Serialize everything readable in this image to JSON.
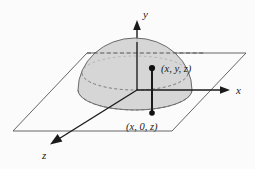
{
  "figure": {
    "name": "hemisphere-on-xz-plane-diagram",
    "background_color": "#fbfbfb",
    "stroke_color": "#1a1a1a",
    "plane_stroke_color": "#555555",
    "dome_fill_color": "#d2d2d2",
    "dome_stroke_color": "#6a6a6a",
    "dashed_stroke_color": "#707070"
  },
  "axes": {
    "y": {
      "label": "y",
      "label_x": 143,
      "label_y": 18,
      "arrow": "up"
    },
    "x": {
      "label": "x",
      "label_x": 236,
      "label_y": 94,
      "arrow": "right"
    },
    "z": {
      "label": "z",
      "label_x": 42,
      "label_y": 159,
      "arrow": "down-left"
    }
  },
  "points": [
    {
      "id": "point-upper",
      "label": "(x, y, z)",
      "dot_x": 152,
      "dot_y": 68,
      "label_x": 161,
      "label_y": 72
    },
    {
      "id": "point-lower",
      "label": "(x, 0, z)",
      "dot_x": 152,
      "dot_y": 113,
      "label_x": 126,
      "label_y": 130
    }
  ],
  "segment": {
    "name": "vertical-drop-segment",
    "x": 152,
    "y_top": 68,
    "y_bottom": 113
  },
  "plane": {
    "name": "xz-plane",
    "corners": [
      {
        "x": 87,
        "y": 53
      },
      {
        "x": 246,
        "y": 53
      },
      {
        "x": 172,
        "y": 131
      },
      {
        "x": 13,
        "y": 131
      }
    ]
  },
  "dome": {
    "name": "hemisphere",
    "center_x": 135,
    "base_y": 90,
    "radius_x": 57,
    "apex_y": 38,
    "base_ellipse_ry": 20,
    "rim_ellipse_ry": 17,
    "rim_center_y": 73
  }
}
